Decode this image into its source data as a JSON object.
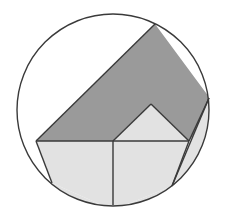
{
  "diagram": {
    "type": "geometry-figure",
    "colors": {
      "background": "#ffffff",
      "stroke": "#3a3a3a",
      "dark_fill": "#9a9a9a",
      "light_fill": "#e2e2e2"
    },
    "circle": {
      "cx": 113,
      "cy": 110,
      "r": 96
    },
    "shapes": {
      "dark_band": {
        "fill": "dark",
        "points": [
          [
            36,
            141
          ],
          [
            155,
            24
          ],
          [
            209,
            98
          ],
          [
            189,
            141
          ],
          [
            151,
            104
          ],
          [
            113,
            141
          ]
        ]
      },
      "left_square": {
        "fill": "light",
        "points": [
          [
            36,
            141
          ],
          [
            113,
            141
          ],
          [
            113,
            205
          ],
          [
            52,
            183
          ]
        ]
      },
      "right_square": {
        "fill": "light",
        "points": [
          [
            113,
            141
          ],
          [
            189,
            141
          ],
          [
            172,
            186
          ],
          [
            113,
            205
          ]
        ]
      },
      "triangle": {
        "fill": "light",
        "points": [
          [
            113,
            141
          ],
          [
            151,
            104
          ],
          [
            189,
            141
          ]
        ]
      },
      "right_sliver": {
        "fill": "light",
        "points": [
          [
            209,
            98
          ],
          [
            172,
            186
          ]
        ]
      }
    }
  }
}
